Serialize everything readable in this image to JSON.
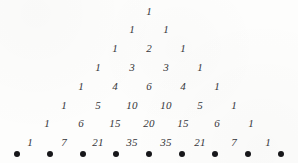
{
  "figure": {
    "ink_color": "#35353a",
    "dot_color": "#17171a",
    "background_color": "#fdfdfc"
  },
  "chart_data": {
    "type": "table",
    "xlabel": "",
    "ylabel": "",
    "rows": [
      {
        "index": 0,
        "values": [
          "1"
        ]
      },
      {
        "index": 1,
        "values": [
          "1",
          "1"
        ]
      },
      {
        "index": 2,
        "values": [
          "1",
          "2",
          "1"
        ]
      },
      {
        "index": 3,
        "values": [
          "1",
          "3",
          "3",
          "1"
        ]
      },
      {
        "index": 4,
        "values": [
          "1",
          "4",
          "6",
          "4",
          "1"
        ]
      },
      {
        "index": 5,
        "values": [
          "1",
          "5",
          "10",
          "10",
          "5",
          "1"
        ]
      },
      {
        "index": 6,
        "values": [
          "1",
          "6",
          "15",
          "20",
          "15",
          "6",
          "1"
        ]
      },
      {
        "index": 7,
        "values": [
          "1",
          "7",
          "21",
          "35",
          "35",
          "21",
          "7",
          "1"
        ]
      }
    ],
    "markers": {
      "label": "bullet-dots",
      "count": 9,
      "glyph": "filled-circle"
    }
  }
}
